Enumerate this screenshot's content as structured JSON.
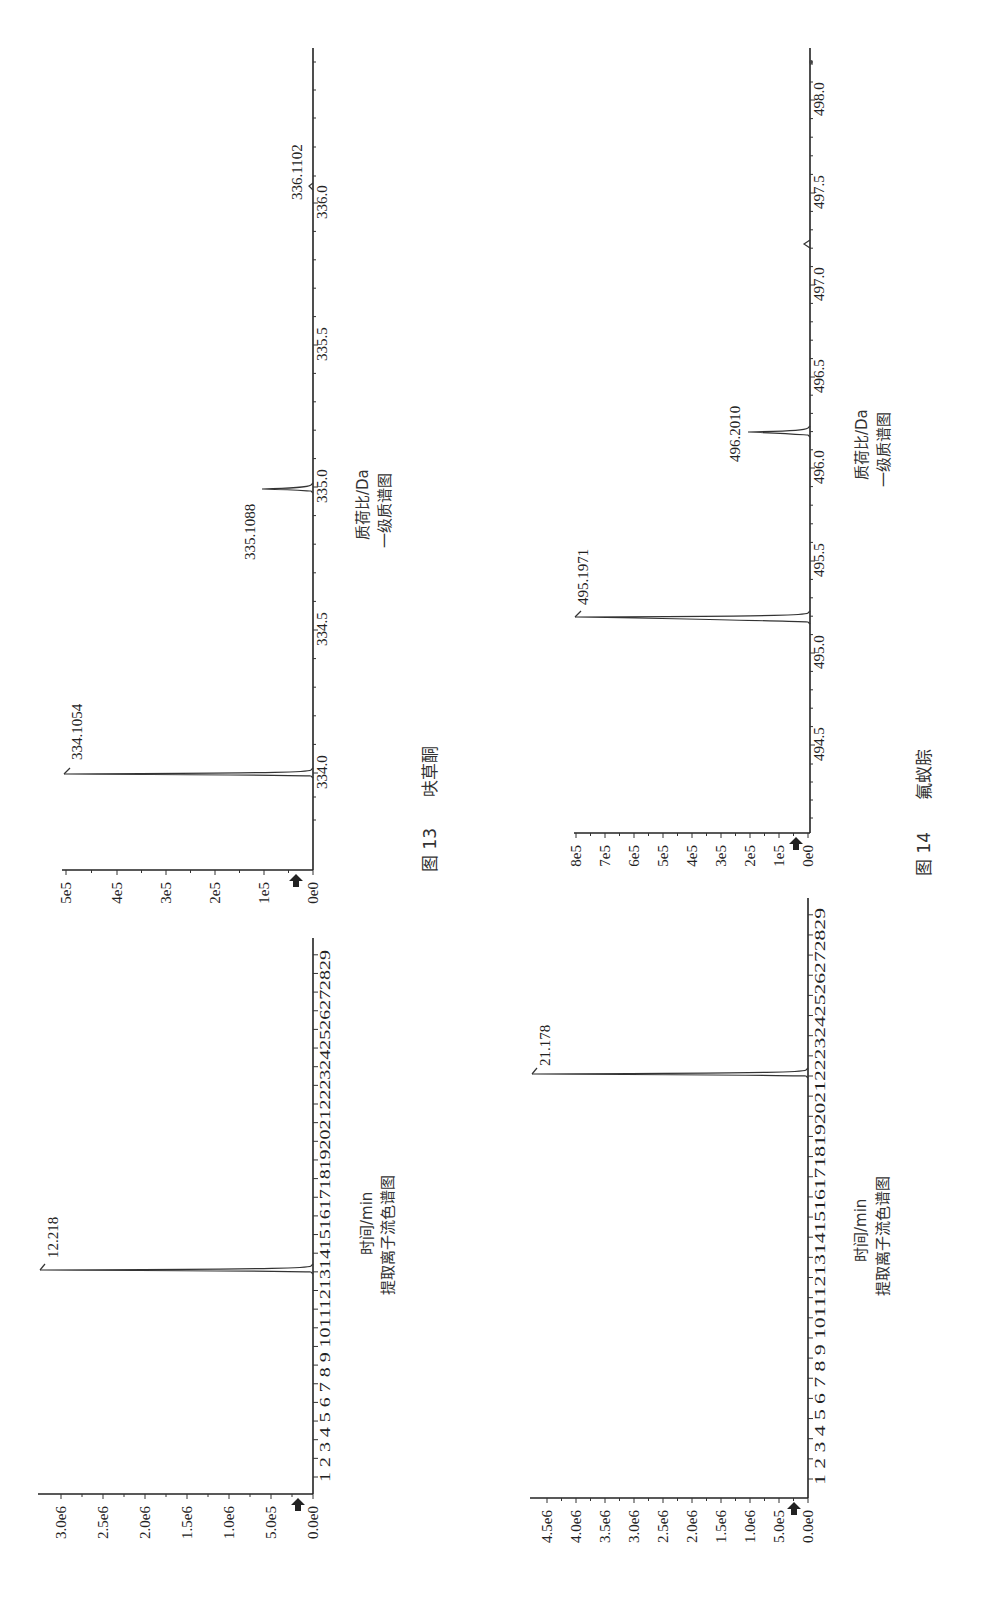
{
  "figures": [
    {
      "caption_num": "图 13",
      "caption_name": "呋草酮",
      "ms": {
        "xlabel": "质荷比/Da",
        "subtitle": "一级质谱图",
        "x_ticks": [
          "334.0",
          "334.5",
          "335.0",
          "335.5",
          "336.0"
        ],
        "y_ticks": [
          "0e0",
          "1e5",
          "2e5",
          "3e5",
          "4e5",
          "5e5"
        ],
        "peaks": [
          {
            "label": "334.1054"
          },
          {
            "label": "335.1088"
          },
          {
            "label": "336.1102"
          }
        ]
      },
      "chrom": {
        "xlabel": "时间/min",
        "subtitle": "提取离子流色谱图",
        "y_ticks": [
          "0.0e0",
          "5.0e5",
          "1.0e6",
          "1.5e6",
          "2.0e6",
          "2.5e6",
          "3.0e6"
        ],
        "peak_label": "12.218"
      }
    },
    {
      "caption_num": "图 14",
      "caption_name": "氟蚁腙",
      "ms": {
        "xlabel": "质荷比/Da",
        "subtitle": "一级质谱图",
        "x_ticks": [
          "494.5",
          "495.0",
          "495.5",
          "496.0",
          "496.5",
          "497.0",
          "497.5",
          "498.0"
        ],
        "y_ticks": [
          "0e0",
          "1e5",
          "2e5",
          "3e5",
          "4e5",
          "5e5",
          "6e5",
          "7e5",
          "8e5"
        ],
        "peaks": [
          {
            "label": "495.1971"
          },
          {
            "label": "496.2010"
          }
        ]
      },
      "chrom": {
        "xlabel": "时间/min",
        "subtitle": "提取离子流色谱图",
        "y_ticks": [
          "0.0e0",
          "5.0e5",
          "1.0e6",
          "1.5e6",
          "2.0e6",
          "2.5e6",
          "3.0e6",
          "3.5e6",
          "4.0e6",
          "4.5e6"
        ],
        "peak_label": "21.178"
      }
    }
  ],
  "time_ticks": [
    "1",
    "2",
    "3",
    "4",
    "5",
    "6",
    "7",
    "8",
    "9",
    "10",
    "11",
    "12",
    "13",
    "14",
    "15",
    "16",
    "17",
    "18",
    "19",
    "20",
    "21",
    "22",
    "23",
    "24",
    "25",
    "26",
    "27",
    "28",
    "29"
  ],
  "chart_data": [
    {
      "type": "line",
      "title": "图 13 呋草酮 一级质谱图",
      "xlabel": "质荷比/Da",
      "ylabel": "",
      "xlim": [
        333.8,
        336.5
      ],
      "ylim": [
        0,
        500000
      ],
      "x": [
        334.1054,
        335.1088,
        336.1102
      ],
      "series": [
        {
          "name": "intensity",
          "values": [
            510000,
            95000,
            5000
          ]
        }
      ],
      "annotations": [
        "334.1054",
        "335.1088",
        "336.1102"
      ],
      "orientation": "rotated 90° counter-clockwise"
    },
    {
      "type": "line",
      "title": "图 13 呋草酮 提取离子流色谱图",
      "xlabel": "时间/min",
      "ylabel": "",
      "xlim": [
        0,
        30
      ],
      "ylim": [
        0,
        3000000
      ],
      "x": [
        12.218
      ],
      "series": [
        {
          "name": "intensity",
          "values": [
            3270000
          ]
        }
      ],
      "annotations": [
        "12.218"
      ],
      "orientation": "rotated 90° counter-clockwise"
    },
    {
      "type": "line",
      "title": "图 14 氟蚁腙 一级质谱图",
      "xlabel": "质荷比/Da",
      "ylabel": "",
      "xlim": [
        494.1,
        498.3
      ],
      "ylim": [
        0,
        800000
      ],
      "x": [
        495.1971,
        496.201,
        497.2
      ],
      "series": [
        {
          "name": "intensity",
          "values": [
            820000,
            230000,
            10000
          ]
        }
      ],
      "annotations": [
        "495.1971",
        "496.2010"
      ],
      "orientation": "rotated 90° counter-clockwise"
    },
    {
      "type": "line",
      "title": "图 14 氟蚁腙 提取离子流色谱图",
      "xlabel": "时间/min",
      "ylabel": "",
      "xlim": [
        0,
        30
      ],
      "ylim": [
        0,
        4500000
      ],
      "x": [
        21.178
      ],
      "series": [
        {
          "name": "intensity",
          "values": [
            4580000
          ]
        }
      ],
      "annotations": [
        "21.178"
      ],
      "orientation": "rotated 90° counter-clockwise"
    }
  ]
}
